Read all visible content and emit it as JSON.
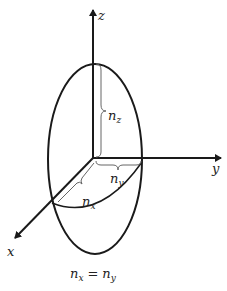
{
  "diagram": {
    "axes": {
      "z": "z",
      "y": "y",
      "x": "x"
    },
    "semi_axes": {
      "nz": {
        "base": "n",
        "sub": "z"
      },
      "ny": {
        "base": "n",
        "sub": "y"
      },
      "nx": {
        "base": "n",
        "sub": "x"
      }
    },
    "caption": {
      "left_base": "n",
      "left_sub": "x",
      "eq": "=",
      "right_base": "n",
      "right_sub": "y"
    },
    "colors": {
      "line": "#1a1a1a",
      "brace": "#666666"
    }
  }
}
